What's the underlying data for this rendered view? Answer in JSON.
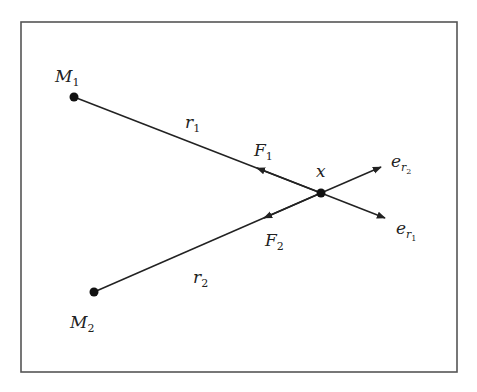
{
  "diagram": {
    "frame": {
      "x": 21,
      "y": 22,
      "width": 436,
      "height": 350,
      "stroke": "#555555"
    },
    "colors": {
      "line": "#222222",
      "point": "#111111"
    },
    "points": {
      "M1": {
        "x": 74,
        "y": 97
      },
      "M2": {
        "x": 94,
        "y": 292
      },
      "X": {
        "x": 321,
        "y": 193
      }
    },
    "labels": {
      "M1": {
        "main": "M",
        "sub": "1"
      },
      "M2": {
        "main": "M",
        "sub": "2"
      },
      "r1": {
        "main": "r",
        "sub": "1"
      },
      "r2": {
        "main": "r",
        "sub": "2"
      },
      "F1": {
        "main": "F",
        "sub": "1"
      },
      "F2": {
        "main": "F",
        "sub": "2"
      },
      "x": {
        "main": "x"
      },
      "er1": {
        "main": "e",
        "sub": "r",
        "subsub": "1"
      },
      "er2": {
        "main": "e",
        "sub": "r",
        "subsub": "2"
      }
    }
  }
}
